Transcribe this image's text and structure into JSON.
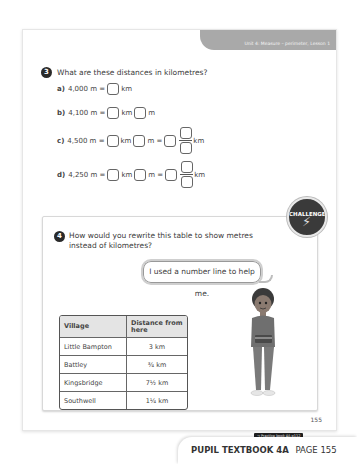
{
  "header": {
    "unit_label": "Unit 4: Measure – perimeter, Lesson 1"
  },
  "question3": {
    "number": "3",
    "prompt": "What are these distances in kilometres?",
    "parts": [
      {
        "label": "a)",
        "expr": "4,000 m =",
        "units": [
          "km"
        ]
      },
      {
        "label": "b)",
        "expr": "4,100 m =",
        "units": [
          "km",
          "m"
        ]
      },
      {
        "label": "c)",
        "expr": "4,500 m =",
        "units": [
          "km",
          "m =",
          "km"
        ]
      },
      {
        "label": "d)",
        "expr": "4,250 m =",
        "units": [
          "km",
          "m =",
          "km"
        ]
      }
    ]
  },
  "question4": {
    "number": "4",
    "prompt_line1": "How would you rewrite this table to show metres",
    "prompt_line2": "instead of kilometres?",
    "badge": "CHALLENGE",
    "speech": "I used a number line to help me.",
    "table": {
      "headers": [
        "Village",
        "Distance from here"
      ],
      "rows": [
        {
          "village": "Little Bampton",
          "distance": "3 km"
        },
        {
          "village": "Battley",
          "distance": "¾ km"
        },
        {
          "village": "Kingsbridge",
          "distance": "7½ km"
        },
        {
          "village": "Southwell",
          "distance": "1¼ km"
        }
      ]
    }
  },
  "footer": {
    "page_number": "155",
    "practice_ref": "→ Practice book 4A p112",
    "textbook_label": "PUPIL TEXTBOOK 4A",
    "textbook_page": "PAGE 155"
  }
}
